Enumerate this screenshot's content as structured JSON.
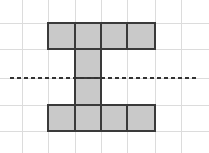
{
  "figure": {
    "background_color": "#ffffff",
    "grid": {
      "line_color": "#dcdcdc",
      "line_width": 1,
      "spacing": 26,
      "vertical_lines": [
        22,
        48,
        75,
        101,
        127,
        155,
        181
      ],
      "horizontal_lines": [
        23,
        49,
        78,
        105,
        131
      ]
    },
    "shape": {
      "name": "capital-I-polyomino",
      "fill_color": "#c9c9c9",
      "stroke_color": "#3a3a3a",
      "stroke_width": 2,
      "cell_size": 26,
      "cell_count": 10,
      "cells": [
        {
          "label": "top-bar-cell-1",
          "x": 48,
          "y": 23,
          "w": 27,
          "h": 26
        },
        {
          "label": "top-bar-cell-2",
          "x": 75,
          "y": 23,
          "w": 26,
          "h": 26
        },
        {
          "label": "top-bar-cell-3",
          "x": 101,
          "y": 23,
          "w": 26,
          "h": 26
        },
        {
          "label": "top-bar-cell-4",
          "x": 127,
          "y": 23,
          "w": 28,
          "h": 26
        },
        {
          "label": "stem-cell-upper",
          "x": 75,
          "y": 49,
          "w": 26,
          "h": 29
        },
        {
          "label": "stem-cell-lower",
          "x": 75,
          "y": 78,
          "w": 26,
          "h": 27
        },
        {
          "label": "bottom-bar-cell-1",
          "x": 48,
          "y": 105,
          "w": 27,
          "h": 26
        },
        {
          "label": "bottom-bar-cell-2",
          "x": 75,
          "y": 105,
          "w": 26,
          "h": 26
        },
        {
          "label": "bottom-bar-cell-3",
          "x": 101,
          "y": 105,
          "w": 26,
          "h": 26
        },
        {
          "label": "bottom-bar-cell-4",
          "x": 127,
          "y": 105,
          "w": 28,
          "h": 26
        }
      ]
    },
    "symmetry_line": {
      "label": "horizontal-dashed-line-of-symmetry",
      "color": "#333333",
      "y": 78,
      "x_start": 10,
      "x_end": 197,
      "style": "dashed",
      "dash": "4 3",
      "width": 2
    }
  }
}
